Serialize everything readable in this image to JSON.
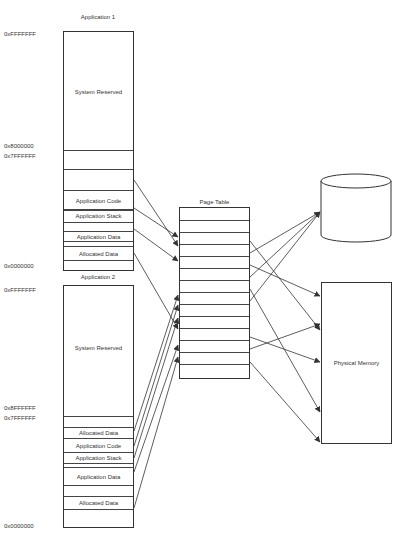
{
  "app1": {
    "title": "Application 1",
    "addresses": [
      "0xFFFFFFF",
      "0x8000000",
      "0x7FFFFFF",
      "0x0000000"
    ],
    "reserved_label": "System Reserved",
    "segments": [
      "Application Code",
      "Application Stack",
      "Application Data",
      "Allocated Data"
    ]
  },
  "app2": {
    "title": "Application 2",
    "addresses": [
      "0xFFFFFFF",
      "0x8FFFFFF",
      "0x7FFFFFF",
      "0x0000000"
    ],
    "reserved_label": "System Reserved",
    "segments": [
      "Allocated Data",
      "Application Code",
      "Application Stack",
      "Application Data",
      "Allocated Data"
    ]
  },
  "page_table": {
    "title": "Page Table",
    "row_count": 16
  },
  "paging_file": {
    "label": "Paging File"
  },
  "physical_memory": {
    "label": "Physical Memory"
  },
  "colors": {
    "line": "#333333",
    "background": "#ffffff"
  }
}
